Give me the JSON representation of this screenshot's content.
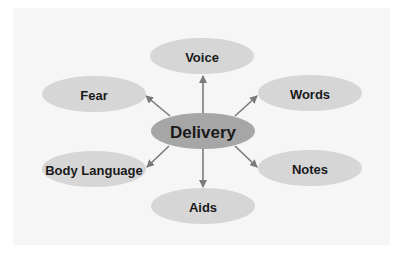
{
  "diagram": {
    "type": "hub-and-spoke",
    "center": {
      "id": "delivery",
      "label": "Delivery",
      "cx": 203,
      "cy": 131,
      "rx": 52,
      "ry": 18,
      "fill": "#a6a6a6",
      "font_size": 17
    },
    "nodes": [
      {
        "id": "voice",
        "label": "Voice",
        "cx": 202,
        "cy": 56,
        "rx": 52,
        "ry": 18,
        "fill": "#d6d6d6",
        "font_size": 13,
        "arrow": {
          "x1": 203,
          "y1": 113,
          "x2": 203,
          "y2": 76
        }
      },
      {
        "id": "fear",
        "label": "Fear",
        "cx": 94,
        "cy": 94,
        "rx": 52,
        "ry": 18,
        "fill": "#d6d6d6",
        "font_size": 13,
        "arrow": {
          "x1": 170,
          "y1": 116,
          "x2": 146,
          "y2": 96
        }
      },
      {
        "id": "words",
        "label": "Words",
        "cx": 310,
        "cy": 93,
        "rx": 52,
        "ry": 18,
        "fill": "#d6d6d6",
        "font_size": 13,
        "arrow": {
          "x1": 235,
          "y1": 116,
          "x2": 257,
          "y2": 96
        }
      },
      {
        "id": "body-language",
        "label": "Body Language",
        "cx": 94,
        "cy": 169,
        "rx": 52,
        "ry": 18,
        "fill": "#d6d6d6",
        "font_size": 13,
        "arrow": {
          "x1": 169,
          "y1": 146,
          "x2": 147,
          "y2": 167
        }
      },
      {
        "id": "notes",
        "label": "Notes",
        "cx": 310,
        "cy": 168,
        "rx": 52,
        "ry": 18,
        "fill": "#d6d6d6",
        "font_size": 13,
        "arrow": {
          "x1": 235,
          "y1": 146,
          "x2": 257,
          "y2": 167
        }
      },
      {
        "id": "aids",
        "label": "Aids",
        "cx": 203,
        "cy": 206,
        "rx": 52,
        "ry": 18,
        "fill": "#d6d6d6",
        "font_size": 13,
        "arrow": {
          "x1": 203,
          "y1": 149,
          "x2": 203,
          "y2": 187
        }
      }
    ],
    "arrow_color": "#7a7a7a",
    "text_color": "#1a1a1a",
    "panel_color": "#f6f6f6"
  }
}
